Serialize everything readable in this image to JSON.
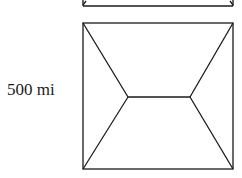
{
  "diagram": {
    "label": "500 mi",
    "stroke_color": "#1a1a1a",
    "square": {
      "x1": 83,
      "y1": 23,
      "x2": 233,
      "y2": 169
    },
    "steiner_points": [
      {
        "x": 128,
        "y": 97
      },
      {
        "x": 190,
        "y": 97
      }
    ],
    "partial_top_shape": {
      "bottom_y": 6,
      "x1": 83,
      "x2": 233
    }
  }
}
